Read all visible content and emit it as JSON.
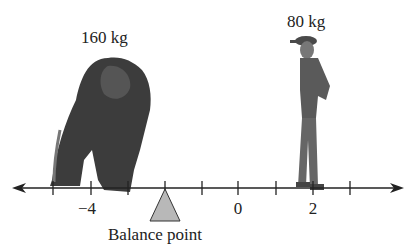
{
  "figure": {
    "gorilla": {
      "label": "160 kg",
      "mass_kg": 160,
      "position": -3.5
    },
    "person": {
      "label": "80 kg",
      "mass_kg": 80,
      "position": 2
    },
    "fulcrum": {
      "label": "Balance point",
      "position": -2,
      "fill": "#b8b8b8"
    },
    "number_line": {
      "min_tick": -5,
      "max_tick": 3,
      "step": 1,
      "labeled_ticks": [
        {
          "value": -4,
          "text": "−4"
        },
        {
          "value": 0,
          "text": "0"
        },
        {
          "value": 2,
          "text": "2"
        }
      ],
      "arrows": "both"
    }
  }
}
